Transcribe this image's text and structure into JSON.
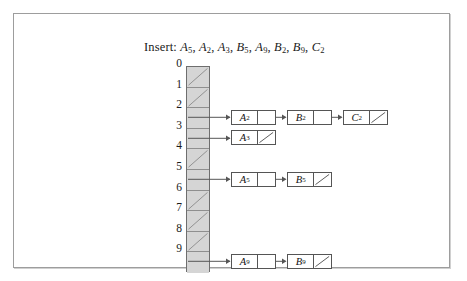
{
  "figure": {
    "type": "hash-table-separate-chaining",
    "caption": {
      "prefix": "Insert:",
      "keys": [
        {
          "letter": "A",
          "sub": "5"
        },
        {
          "letter": "A",
          "sub": "2"
        },
        {
          "letter": "A",
          "sub": "3"
        },
        {
          "letter": "B",
          "sub": "5"
        },
        {
          "letter": "A",
          "sub": "9"
        },
        {
          "letter": "B",
          "sub": "2"
        },
        {
          "letter": "B",
          "sub": "9"
        },
        {
          "letter": "C",
          "sub": "2"
        }
      ],
      "text": "Insert: A5, A2, A3, B5, A9, B2, B9, C2"
    },
    "table": {
      "slot_count": 10,
      "index_labels": [
        "0",
        "1",
        "2",
        "3",
        "4",
        "5",
        "6",
        "7",
        "8",
        "9"
      ],
      "slots": [
        {
          "index": "0",
          "empty": true,
          "chain": []
        },
        {
          "index": "1",
          "empty": true,
          "chain": []
        },
        {
          "index": "2",
          "empty": false,
          "chain": [
            {
              "letter": "A",
              "sub": "2",
              "terminal": false
            },
            {
              "letter": "B",
              "sub": "2",
              "terminal": false
            },
            {
              "letter": "C",
              "sub": "2",
              "terminal": true
            }
          ]
        },
        {
          "index": "3",
          "empty": false,
          "chain": [
            {
              "letter": "A",
              "sub": "3",
              "terminal": true
            }
          ]
        },
        {
          "index": "4",
          "empty": true,
          "chain": []
        },
        {
          "index": "5",
          "empty": false,
          "chain": [
            {
              "letter": "A",
              "sub": "5",
              "terminal": false
            },
            {
              "letter": "B",
              "sub": "5",
              "terminal": true
            }
          ]
        },
        {
          "index": "6",
          "empty": true,
          "chain": []
        },
        {
          "index": "7",
          "empty": true,
          "chain": []
        },
        {
          "index": "8",
          "empty": true,
          "chain": []
        },
        {
          "index": "9",
          "empty": false,
          "chain": [
            {
              "letter": "A",
              "sub": "9",
              "terminal": false
            },
            {
              "letter": "B",
              "sub": "9",
              "terminal": true
            }
          ]
        }
      ]
    },
    "colors": {
      "frame_border": "#9d9d9d",
      "array_fill": "#d5d5d5",
      "array_border": "#6e6e6e",
      "cell_divider": "#8f8f8f",
      "node_border": "#555555",
      "node_fill": "#ffffff",
      "text": "#1a1a1a",
      "background": "#ffffff"
    }
  }
}
